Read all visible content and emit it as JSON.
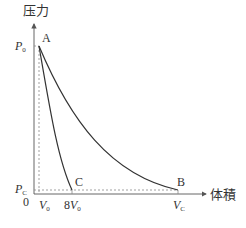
{
  "diagram": {
    "y_axis_label": "压力",
    "x_axis_label": "体積",
    "origin_label": "0",
    "y_ticks": {
      "p0_main": "P",
      "p0_sub": "0",
      "pc_main": "P",
      "pc_sub": "C"
    },
    "x_ticks": {
      "v0_main": "V",
      "v0_sub": "0",
      "v8_coef": "8",
      "v8_main": "V",
      "v8_sub": "0",
      "vc_main": "V",
      "vc_sub": "C"
    },
    "points": {
      "a": "A",
      "b": "B",
      "c": "C"
    },
    "colors": {
      "curve": "#333333",
      "axis": "#555555",
      "dashed": "#888888"
    }
  }
}
